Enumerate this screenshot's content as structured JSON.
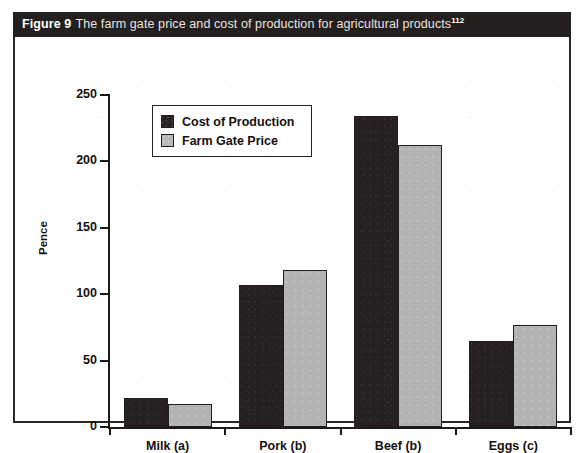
{
  "figure": {
    "label": "Figure 9",
    "caption": "The farm gate price and cost of production for agricultural products",
    "footnote_marker": "112"
  },
  "chart_data": {
    "type": "bar",
    "title": "The farm gate price and cost of production for agricultural products",
    "categories": [
      "Milk (a)",
      "Pork (b)",
      "Beef (b)",
      "Eggs (c)"
    ],
    "series": [
      {
        "name": "Cost of Production",
        "color": "#262020",
        "values": [
          22,
          107,
          234,
          65
        ]
      },
      {
        "name": "Farm Gate Price",
        "color": "#b3b3b3",
        "values": [
          17,
          118,
          212,
          77
        ]
      }
    ],
    "xlabel": "",
    "ylabel": "Pence",
    "ylim": [
      0,
      250
    ],
    "yticks": [
      0,
      50,
      100,
      150,
      200,
      250
    ],
    "ytick_labels": [
      "0",
      "50",
      "100",
      "150",
      "200",
      "250"
    ],
    "grid": false,
    "legend_position": "upper left"
  }
}
